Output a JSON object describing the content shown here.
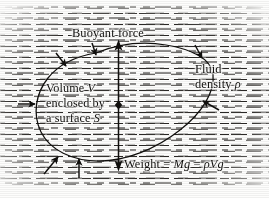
{
  "figure": {
    "width": 269,
    "height": 198,
    "background_color": "#fdfdfc",
    "ink_color": "#100f0d",
    "hatch_color": "#2a2826"
  },
  "labels": {
    "buoyant_force": "Buoyant force",
    "volume_line1": "Volume",
    "volume_line1_sym": "V",
    "volume_line2": "enclosed by",
    "volume_line3_a": "a surface",
    "volume_line3_sym": "S",
    "fluid_line1": "Fluid",
    "fluid_line2_a": "density",
    "fluid_line2_sym": "ρ",
    "weight_text": "Weight  =  ",
    "weight_sym1": "Mg",
    "weight_eq2": "  =  ",
    "weight_sym2": "ρVg"
  },
  "elements": {
    "fluid_region_name": "fluid-hatching",
    "body_outline_name": "submerged-body-outline",
    "force_axis_name": "vertical-force-axis",
    "center_marker_name": "center-of-buoyancy-marker",
    "pressure_arrows_count": 7
  },
  "geometry": {
    "body_path": "M 96,53 C 118,44 142,41 166,45 C 190,49 211,58 213,74 C 215,92 202,113 180,130 C 156,149 126,161 99,161 C 72,161 50,150 41,132 C 32,114 36,93 48,78 C 60,63 78,56 96,53 Z",
    "axis_x": 118.5,
    "axis_top_y": 41,
    "axis_bottom_y": 170,
    "center_marker_y": 105
  },
  "pressure_arrows": [
    {
      "name": "pressure-arrow-top-left",
      "x1": 56,
      "y1": 53,
      "x2": 66,
      "y2": 66
    },
    {
      "name": "pressure-arrow-top-mid",
      "x1": 92,
      "y1": 43,
      "x2": 96,
      "y2": 55
    },
    {
      "name": "pressure-arrow-top-right",
      "x1": 195,
      "y1": 45,
      "x2": 202,
      "y2": 58
    },
    {
      "name": "pressure-arrow-right",
      "x1": 219,
      "y1": 110,
      "x2": 203,
      "y2": 101
    },
    {
      "name": "pressure-arrow-left",
      "x1": 18,
      "y1": 104,
      "x2": 35,
      "y2": 104
    },
    {
      "name": "pressure-arrow-bottom-left",
      "x1": 44,
      "y1": 174,
      "x2": 58,
      "y2": 157
    },
    {
      "name": "pressure-arrow-bottom-mid",
      "x1": 79,
      "y1": 178,
      "x2": 79,
      "y2": 159
    }
  ]
}
